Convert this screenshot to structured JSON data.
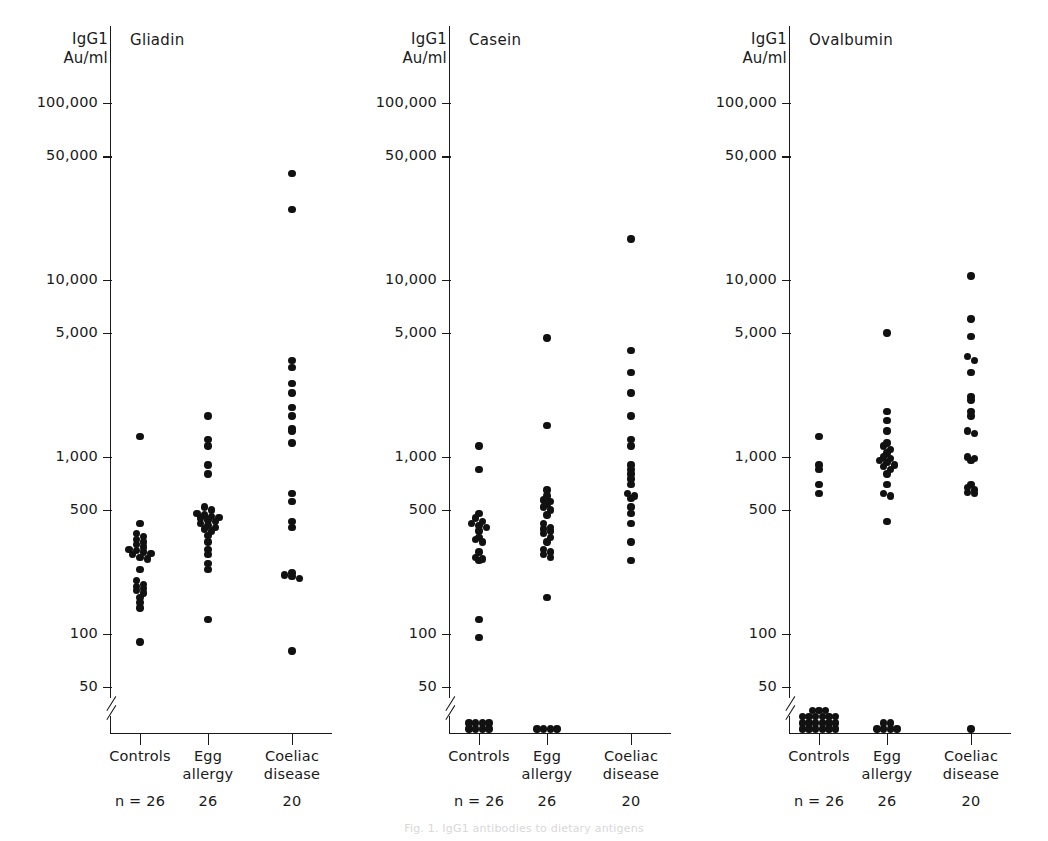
{
  "figure": {
    "axis_label": "IgG1\nAu/ml",
    "caption": "Fig. 1. IgG1 antibodies to dietary antigens"
  },
  "axis": {
    "tick_labels": [
      "100,000",
      "50,000",
      "10,000",
      "5,000",
      "1,000",
      "500",
      "100",
      "50"
    ],
    "tick_values": [
      100000,
      50000,
      10000,
      5000,
      1000,
      500,
      100,
      50
    ],
    "break_below": 50,
    "scale": "log"
  },
  "groups": [
    {
      "label": "Controls",
      "n_label": "n = 26",
      "n": 26
    },
    {
      "label": "Egg\nallergy",
      "n_label": "26",
      "n": 26
    },
    {
      "label": "Coeliac\ndisease",
      "n_label": "20",
      "n": 20
    }
  ],
  "panels": [
    {
      "id": "gliadin",
      "title": "Gliadin"
    },
    {
      "id": "casein",
      "title": "Casein"
    },
    {
      "id": "ovalbumin",
      "title": "Ovalbumin"
    }
  ],
  "chart_data": {
    "type": "scatter",
    "ylabel": "IgG1 Au/ml",
    "xlabel": "",
    "yscale": "log",
    "ylim": [
      50,
      100000
    ],
    "yticks": [
      50,
      100,
      500,
      1000,
      5000,
      10000,
      50000,
      100000
    ],
    "ytick_labels": [
      "50",
      "100",
      "500",
      "1,000",
      "5,000",
      "10,000",
      "50,000",
      "100,000"
    ],
    "axis_break_below": 50,
    "below_detection_marker": "plotted on baseline below axis break",
    "grid": false,
    "legend": null,
    "categories": [
      "Controls",
      "Egg allergy",
      "Coeliac disease"
    ],
    "group_counts": [
      26,
      26,
      20
    ],
    "panels": [
      {
        "name": "Gliadin",
        "series": [
          {
            "name": "Controls",
            "values": [
              1300,
              420,
              370,
              355,
              340,
              330,
              320,
              310,
              300,
              295,
              290,
              285,
              280,
              270,
              265,
              230,
              200,
              190,
              185,
              180,
              175,
              170,
              160,
              150,
              140,
              90
            ],
            "below_detection": 0
          },
          {
            "name": "Egg allergy",
            "values": [
              1700,
              1250,
              1150,
              900,
              800,
              520,
              500,
              480,
              470,
              460,
              455,
              450,
              440,
              430,
              420,
              410,
              400,
              390,
              380,
              360,
              330,
              300,
              280,
              250,
              230,
              120
            ],
            "below_detection": 0
          },
          {
            "name": "Coeliac disease",
            "values": [
              40000,
              25000,
              3500,
              3200,
              2600,
              2300,
              1900,
              1700,
              1450,
              1400,
              1200,
              620,
              560,
              430,
              400,
              220,
              215,
              210,
              205,
              80
            ],
            "below_detection": 0
          }
        ]
      },
      {
        "name": "Casein",
        "series": [
          {
            "name": "Controls",
            "values": [
              1150,
              850,
              480,
              450,
              430,
              420,
              410,
              400,
              380,
              350,
              340,
              330,
              290,
              270,
              265,
              260,
              120,
              95
            ],
            "below_detection": 8
          },
          {
            "name": "Egg allergy",
            "values": [
              4700,
              1500,
              650,
              600,
              570,
              560,
              540,
              520,
              500,
              470,
              420,
              400,
              390,
              380,
              370,
              350,
              330,
              300,
              290,
              280,
              270,
              160
            ],
            "below_detection": 4
          },
          {
            "name": "Coeliac disease",
            "values": [
              17000,
              4000,
              3000,
              2300,
              1700,
              1250,
              1150,
              900,
              850,
              800,
              750,
              700,
              620,
              600,
              580,
              520,
              480,
              420,
              330,
              260
            ],
            "below_detection": 0
          }
        ]
      },
      {
        "name": "Ovalbumin",
        "series": [
          {
            "name": "Controls",
            "values": [
              1300,
              900,
              850,
              700,
              620
            ],
            "below_detection": 21
          },
          {
            "name": "Egg allergy",
            "values": [
              5000,
              1800,
              1600,
              1400,
              1200,
              1150,
              1100,
              1050,
              1000,
              980,
              950,
              930,
              900,
              880,
              850,
              800,
              700,
              620,
              600,
              430
            ],
            "below_detection": 6
          },
          {
            "name": "Coeliac disease",
            "values": [
              10500,
              6000,
              4800,
              3700,
              3500,
              3000,
              2200,
              2100,
              1800,
              1700,
              1400,
              1350,
              1000,
              980,
              950,
              700,
              670,
              650,
              630,
              620
            ],
            "below_detection": 1
          }
        ]
      }
    ]
  }
}
